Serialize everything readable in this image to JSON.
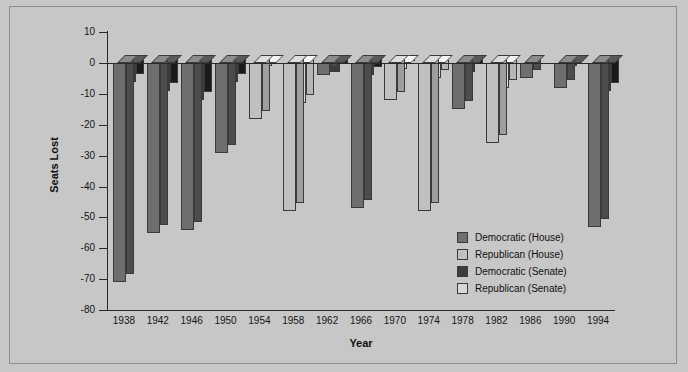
{
  "chart_data": {
    "type": "bar",
    "title": "",
    "xlabel": "Year",
    "ylabel": "Seats Lost",
    "ylim": [
      -80,
      10
    ],
    "ytick_step": 10,
    "yticks": [
      10,
      0,
      -10,
      -20,
      -30,
      -40,
      -50,
      -60,
      -70,
      -80
    ],
    "grid": false,
    "legend_position": "inside-right",
    "categories": [
      "1938",
      "1942",
      "1946",
      "1950",
      "1954",
      "1958",
      "1962",
      "1966",
      "1970",
      "1974",
      "1978",
      "1982",
      "1986",
      "1990",
      "1994"
    ],
    "series": [
      {
        "name": "Democratic (House)",
        "color": "#6e6e6e",
        "values": [
          -71,
          -55,
          -54,
          -29,
          0,
          0,
          -4,
          -47,
          0,
          0,
          -15,
          0,
          -5,
          -8,
          -53
        ]
      },
      {
        "name": "Republican (House)",
        "color": "#c0c0c0",
        "values": [
          0,
          0,
          0,
          0,
          -18,
          -48,
          0,
          0,
          -12,
          -48,
          0,
          -26,
          0,
          0,
          0
        ]
      },
      {
        "name": "Democratic (Senate)",
        "color": "#3c3c3c",
        "values": [
          -6,
          -9,
          -12,
          -6,
          0,
          0,
          -3,
          -4,
          0,
          0,
          -3,
          0,
          0,
          -1,
          -9
        ]
      },
      {
        "name": "Republican (Senate)",
        "color": "#d8d8d8",
        "values": [
          0,
          0,
          0,
          0,
          -1,
          -13,
          0,
          0,
          -2,
          -5,
          0,
          -8,
          0,
          0,
          0
        ]
      }
    ]
  },
  "legend": {
    "items": [
      {
        "label": "Democratic (House)"
      },
      {
        "label": "Republican (House)"
      },
      {
        "label": "Democratic (Senate)"
      },
      {
        "label": "Republican (Senate)"
      }
    ]
  }
}
